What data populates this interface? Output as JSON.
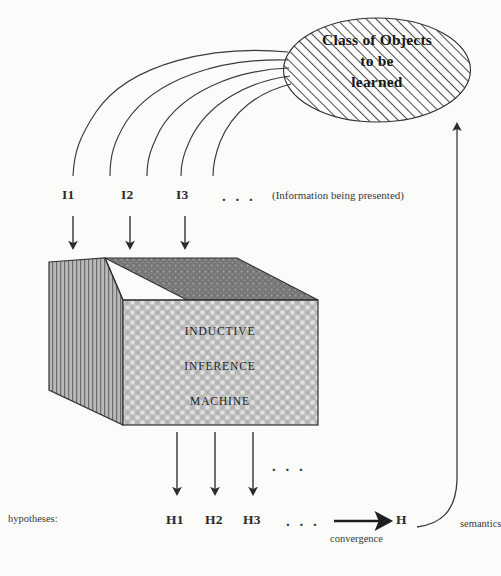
{
  "figure": {
    "title_ellipse": "Class of Objects\nto be\nlearned",
    "ellipse_lines": [
      "Class of Objects",
      "to be",
      "learned"
    ],
    "note_information": "(Information being presented)",
    "inputs": [
      {
        "id": "I1",
        "label": "I1"
      },
      {
        "id": "I2",
        "label": "I2"
      },
      {
        "id": "I3",
        "label": "I3"
      }
    ],
    "inputs_ellipsis": ". . .",
    "machine": {
      "lines": [
        "INDUCTIVE",
        "INFERENCE",
        "MACHINE"
      ]
    },
    "outputs_ellipsis_top": ". . .",
    "hypotheses_label": "hypotheses:",
    "hypotheses": [
      {
        "id": "H1",
        "label": "H1"
      },
      {
        "id": "H2",
        "label": "H2"
      },
      {
        "id": "H3",
        "label": "H3"
      }
    ],
    "hypotheses_ellipsis": ". . .",
    "limit_hypothesis": "H",
    "convergence_label": "convergence",
    "semantics_label": "semantics",
    "colors": {
      "ink": "#2b2b2b",
      "paper": "#fbfbfa",
      "box_top": "#6f6f6f",
      "box_left": "#9a9a9a",
      "box_front": "#c8c8c8",
      "hatch": "#555555"
    }
  }
}
